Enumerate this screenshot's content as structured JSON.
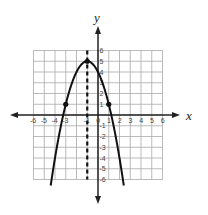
{
  "chart_data": {
    "type": "line",
    "title": "",
    "xlabel": "x",
    "ylabel": "y",
    "xlim": [
      -6,
      6
    ],
    "ylim": [
      -6,
      6
    ],
    "grid": true,
    "x_ticks": [
      "-6",
      "-5",
      "-4",
      "-3",
      "-1",
      "0",
      "1",
      "2",
      "3",
      "4",
      "5",
      "6"
    ],
    "y_ticks": [
      "6",
      "5",
      "4",
      "3",
      "2",
      "1",
      "-1",
      "-2",
      "-3",
      "-4",
      "-5",
      "-6"
    ],
    "series": [
      {
        "name": "parabola",
        "equation": "y = -x^2 - 2x + 4",
        "vertex": [
          -1,
          5
        ],
        "points": [
          [
            -3,
            1
          ],
          [
            -1,
            5
          ],
          [
            1,
            1
          ]
        ],
        "x_range": [
          -4.4,
          2.4
        ]
      }
    ],
    "axis_of_symmetry": {
      "x": -1,
      "style": "dashed"
    }
  },
  "labels": {
    "x_axis": "x",
    "y_axis": "y"
  }
}
